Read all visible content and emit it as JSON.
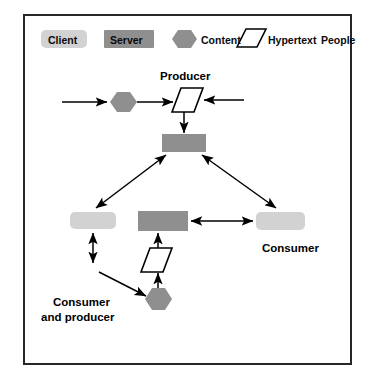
{
  "figure": {
    "border_color": "#262626",
    "background": "#ffffff"
  },
  "palette": {
    "client_fill": "#d2d2d2",
    "server_fill": "#8f8f8f",
    "content_fill": "#8f8f8f",
    "hypertext_fill": "#ffffff",
    "line_color": "#000000",
    "text_color": "#000000"
  },
  "legend": {
    "items": [
      {
        "key": "client",
        "label": "Client",
        "shape": "rounded-rectangle",
        "fill": "#d2d2d2",
        "label_inside": true
      },
      {
        "key": "server",
        "label": "Server",
        "shape": "rectangle",
        "fill": "#8f8f8f",
        "label_inside": true
      },
      {
        "key": "content",
        "label": "Content",
        "shape": "hexagon",
        "fill": "#8f8f8f",
        "label_inside": false
      },
      {
        "key": "hypertext",
        "label": "Hypertext",
        "shape": "parallelogram",
        "fill": "#ffffff",
        "label_inside": false
      },
      {
        "key": "people",
        "label": "People",
        "shape": "none",
        "fill": "#ffffff",
        "label_inside": false
      }
    ]
  },
  "annotations": {
    "producer": "Producer",
    "consumer": "Consumer",
    "consumer_and_producer_line1": "Consumer",
    "consumer_and_producer_line2": "and producer"
  },
  "nodes": [
    {
      "id": "content-top",
      "type": "content",
      "shape": "hexagon",
      "x": 110,
      "y": 92,
      "w": 26,
      "h": 20
    },
    {
      "id": "hypertext-top",
      "type": "hypertext",
      "shape": "parallelogram",
      "x": 172,
      "y": 88,
      "w": 30,
      "h": 24
    },
    {
      "id": "server-center",
      "type": "server",
      "shape": "rectangle",
      "x": 162,
      "y": 134,
      "w": 44,
      "h": 18
    },
    {
      "id": "client-left",
      "type": "client",
      "shape": "rounded-rectangle",
      "x": 70,
      "y": 212,
      "w": 46,
      "h": 17
    },
    {
      "id": "server-middle",
      "type": "server",
      "shape": "rectangle",
      "x": 138,
      "y": 211,
      "w": 50,
      "h": 20
    },
    {
      "id": "client-right",
      "type": "client",
      "shape": "rounded-rectangle",
      "x": 256,
      "y": 212,
      "w": 49,
      "h": 18
    },
    {
      "id": "hypertext-bottom",
      "type": "hypertext",
      "shape": "parallelogram",
      "x": 141,
      "y": 248,
      "w": 30,
      "h": 24
    },
    {
      "id": "content-bottom",
      "type": "content",
      "shape": "hexagon",
      "x": 145,
      "y": 288,
      "w": 27,
      "h": 22
    }
  ],
  "edges": [
    {
      "id": "e1",
      "from": "left-margin",
      "to": "content-top",
      "style": "arrow"
    },
    {
      "id": "e2",
      "from": "content-top",
      "to": "hypertext-top",
      "style": "arrow"
    },
    {
      "id": "e3",
      "from": "right-margin",
      "to": "hypertext-top",
      "style": "arrow"
    },
    {
      "id": "e4",
      "from": "hypertext-top",
      "to": "server-center",
      "style": "arrow"
    },
    {
      "id": "e5",
      "from": "client-left",
      "to": "server-center",
      "style": "arrow"
    },
    {
      "id": "e6",
      "from": "client-right",
      "to": "server-center",
      "style": "arrow"
    },
    {
      "id": "e7",
      "from": "server-middle",
      "to": "client-right",
      "style": "double-arrow"
    },
    {
      "id": "e8",
      "from": "content-bottom",
      "to": "client-left",
      "style": "arrow"
    },
    {
      "id": "e9",
      "from": "content-bottom",
      "to": "hypertext-bottom",
      "style": "arrow"
    },
    {
      "id": "e10",
      "from": "hypertext-bottom",
      "to": "server-middle",
      "style": "arrow"
    },
    {
      "id": "e11",
      "from": "client-left",
      "to": "below-client-left",
      "style": "double-arrow"
    }
  ]
}
